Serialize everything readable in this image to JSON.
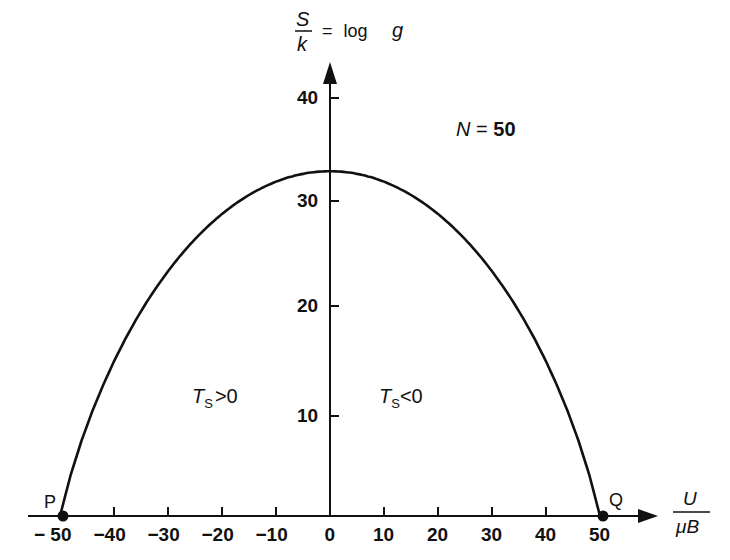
{
  "chart_data": {
    "type": "line",
    "title": "",
    "xlabel": "U / μB",
    "ylabel": "S / k = log g",
    "annotation_N": "N = 50",
    "region_left": "T_S > 0",
    "region_right": "T_S < 0",
    "point_P": {
      "label": "P",
      "x": -50,
      "y": 0
    },
    "point_Q": {
      "label": "Q",
      "x": 50,
      "y": 0
    },
    "xlim": [
      -50,
      55
    ],
    "ylim": [
      0,
      44
    ],
    "x_ticks": [
      -50,
      -40,
      -30,
      -20,
      -10,
      0,
      10,
      20,
      30,
      40,
      50
    ],
    "x_tick_labels": [
      "− 50",
      "−40",
      "−30",
      "−20",
      "−10",
      "0",
      "10",
      "20",
      "30",
      "40",
      "50"
    ],
    "y_ticks": [
      10,
      20,
      30,
      40
    ],
    "y_tick_labels": [
      "10",
      "20",
      "30",
      "40"
    ],
    "grid": false,
    "legend": "none",
    "series": [
      {
        "name": "S/k vs U/μB (N=50)",
        "x": [
          -50,
          -45,
          -40,
          -35,
          -30,
          -25,
          -20,
          -15,
          -10,
          -5,
          0,
          5,
          10,
          15,
          20,
          25,
          30,
          35,
          40,
          45,
          50
        ],
        "values": [
          0,
          14,
          20.5,
          24.5,
          27.5,
          29.5,
          31,
          32,
          32.6,
          32.9,
          33,
          32.9,
          32.6,
          32,
          31,
          29.5,
          27.5,
          24.5,
          20.5,
          14,
          0
        ]
      }
    ]
  },
  "labels": {
    "y_axis_numerator": "S",
    "y_axis_denominator": "k",
    "y_axis_equals": "= log",
    "y_axis_g": "g",
    "x_axis_numerator": "U",
    "x_axis_denominator": "μB",
    "n_label": "N",
    "n_eq": "=",
    "n_value": "50",
    "ts_left_T": "T",
    "ts_left_sub": "S",
    "ts_left_rel": ">0",
    "ts_right_T": "T",
    "ts_right_sub": "S",
    "ts_right_rel": "<0",
    "p": "P",
    "q": "Q"
  }
}
